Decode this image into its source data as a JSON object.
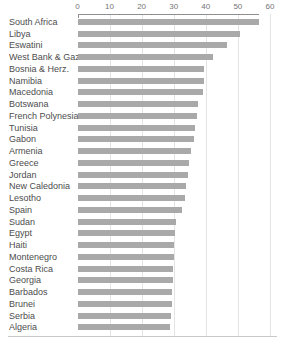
{
  "chart_data": {
    "type": "bar",
    "orientation": "horizontal",
    "categories": [
      "South Africa",
      "Libya",
      "Eswatini",
      "West Bank & Gaza",
      "Bosnia & Herz.",
      "Namibia",
      "Macedonia",
      "Botswana",
      "French Polynesia",
      "Tunisia",
      "Gabon",
      "Armenia",
      "Greece",
      "Jordan",
      "New Caledonia",
      "Lesotho",
      "Spain",
      "Sudan",
      "Egypt",
      "Haiti",
      "Montenegro",
      "Costa Rica",
      "Georgia",
      "Barbados",
      "Brunei",
      "Serbia",
      "Algeria"
    ],
    "values": [
      56.5,
      50.7,
      46.6,
      42.4,
      39.6,
      39.3,
      39.0,
      37.6,
      37.2,
      36.5,
      36.2,
      35.4,
      34.9,
      34.6,
      33.8,
      33.6,
      32.7,
      30.8,
      30.4,
      30.2,
      30.1,
      29.9,
      29.7,
      29.5,
      29.4,
      29.2,
      28.9
    ],
    "value_axis": {
      "position": "top",
      "min": 0,
      "max": 60,
      "ticks": [
        0,
        10,
        20,
        30,
        40,
        50,
        60
      ],
      "gridlines_at": [
        10,
        20,
        30,
        40,
        50,
        60
      ],
      "grid": true
    },
    "legend": "none",
    "colors": {
      "bar": "#a9a9a9",
      "axis_line": "#8f8f8f",
      "gridline": "#e4e4e4",
      "category_label": "#4d4d4d",
      "tick_label": "#757575",
      "bottom_border": "#c9c9c9",
      "background": "#ffffff"
    }
  }
}
